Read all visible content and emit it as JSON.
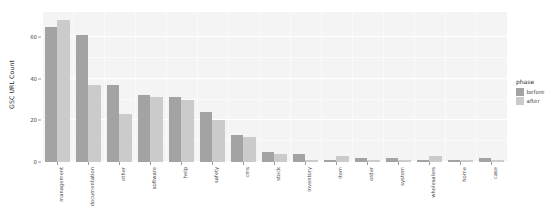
{
  "chart_data": {
    "type": "bar",
    "title": "",
    "xlabel": "",
    "ylabel": "GSC URL Count",
    "ylim": [
      0,
      72
    ],
    "yticks": [
      0,
      20,
      40,
      60
    ],
    "ytick_labels": [
      "0",
      "20",
      "40",
      "60"
    ],
    "grid": true,
    "legend_position": "right",
    "legend_title": "phase",
    "categories": [
      "management",
      "documentation",
      "other",
      "software",
      "help",
      "safety",
      "cms",
      "stock",
      "inventory",
      "item",
      "order",
      "system",
      "wholesalers",
      "home",
      "case"
    ],
    "series": [
      {
        "name": "before",
        "color": "#a3a3a3",
        "values": [
          65,
          61,
          37,
          32,
          31,
          24,
          13,
          5,
          4,
          1,
          2,
          2,
          1,
          1,
          2
        ]
      },
      {
        "name": "after",
        "color": "#cbcbcb",
        "values": [
          68,
          37,
          23,
          31,
          30,
          20,
          12,
          4,
          1,
          3,
          1,
          1,
          3,
          1,
          1
        ]
      }
    ]
  },
  "legend": {
    "title": "phase",
    "items": [
      {
        "label": "before",
        "color": "#a3a3a3"
      },
      {
        "label": "after",
        "color": "#cbcbcb"
      }
    ]
  },
  "axes": {
    "y_title": "GSC URL Count"
  },
  "theme": {
    "panel_background": "#f4f4f4",
    "gridline_color": "#ffffff",
    "text_color": "#4d4d4d",
    "page_background": "#ffffff"
  }
}
